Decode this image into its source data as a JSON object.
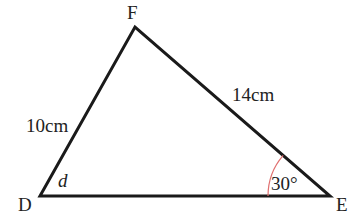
{
  "diagram": {
    "type": "triangle",
    "vertices": [
      {
        "name": "D",
        "label": "D"
      },
      {
        "name": "E",
        "label": "E"
      },
      {
        "name": "F",
        "label": "F"
      }
    ],
    "sides": {
      "DF": "10cm",
      "FE": "14cm"
    },
    "angles": {
      "D": "d",
      "E": "30°"
    },
    "colors": {
      "lines": "#1a1a1a",
      "arc": "#e07070",
      "text": "#222222"
    }
  }
}
